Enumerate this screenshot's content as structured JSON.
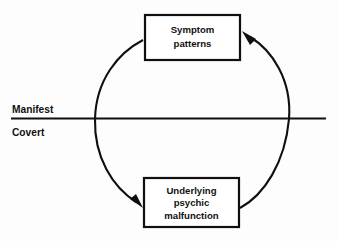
{
  "diagram": {
    "background_color": "#fdfdfd",
    "ink_color": "#0f0f0f",
    "divider": {
      "above_label": "Manifest",
      "below_label": "Covert",
      "label_x": 12,
      "above_label_y": 110,
      "below_label_y": 133,
      "line_y": 118,
      "line_x_start": 11,
      "line_x_end": 326
    },
    "nodes": [
      {
        "id": "symptom-patterns",
        "region": "manifest",
        "lines": [
          "Symptom",
          "patterns"
        ],
        "x": 145,
        "y": 15,
        "width": 95,
        "height": 45
      },
      {
        "id": "underlying-psychic-malfunction",
        "region": "covert",
        "lines": [
          "Underlying",
          "psychic",
          "malfunction"
        ],
        "x": 144,
        "y": 178,
        "width": 95,
        "height": 49
      }
    ],
    "cycle": {
      "center_x": 192,
      "center_y": 119,
      "radius": 97,
      "arrows": [
        {
          "id": "left-arc-down",
          "from": "symptom-patterns",
          "to": "underlying-psychic-malfunction",
          "direction": "counterclockwise-left",
          "arrowhead_x": 142,
          "arrowhead_y": 206
        },
        {
          "id": "right-arc-up",
          "from": "underlying-psychic-malfunction",
          "to": "symptom-patterns",
          "direction": "counterclockwise-right",
          "arrowhead_x": 243,
          "arrowhead_y": 33
        }
      ]
    }
  }
}
